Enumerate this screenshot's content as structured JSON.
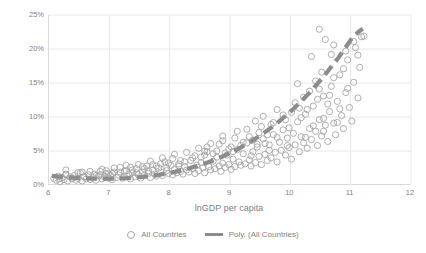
{
  "chart_data": {
    "type": "scatter",
    "title": "",
    "xlabel": "lnGDP per capita",
    "ylabel": "Business Servics Employment Share",
    "xlim": [
      6,
      12
    ],
    "ylim": [
      0,
      25
    ],
    "xticks": [
      "6",
      "7",
      "8",
      "9",
      "10",
      "11",
      "12"
    ],
    "yticks": [
      "0%",
      "5%",
      "10%",
      "15%",
      "20%",
      "25%"
    ],
    "ytick_values": [
      0,
      5,
      10,
      15,
      20,
      25
    ],
    "xtick_values": [
      6,
      7,
      8,
      9,
      10,
      11,
      12
    ],
    "grid": "both-light",
    "legend_position": "bottom",
    "series": [
      {
        "name": "All Countries",
        "type": "scatter",
        "marker": "open-circle",
        "color": "#a6a6a6",
        "points": [
          [
            6.08,
            1.0
          ],
          [
            6.12,
            0.7
          ],
          [
            6.15,
            1.3
          ],
          [
            6.18,
            0.5
          ],
          [
            6.22,
            1.1
          ],
          [
            6.25,
            0.8
          ],
          [
            6.28,
            1.5
          ],
          [
            6.31,
            0.6
          ],
          [
            6.35,
            1.2
          ],
          [
            6.38,
            0.9
          ],
          [
            6.42,
            1.4
          ],
          [
            6.45,
            0.7
          ],
          [
            6.48,
            1.0
          ],
          [
            6.52,
            1.8
          ],
          [
            6.55,
            0.6
          ],
          [
            6.58,
            1.2
          ],
          [
            6.62,
            0.9
          ],
          [
            6.65,
            1.5
          ],
          [
            6.68,
            0.8
          ],
          [
            6.72,
            1.1
          ],
          [
            6.75,
            1.6
          ],
          [
            6.78,
            0.7
          ],
          [
            6.82,
            1.3
          ],
          [
            6.85,
            2.0
          ],
          [
            6.88,
            0.9
          ],
          [
            6.92,
            1.2
          ],
          [
            6.95,
            1.7
          ],
          [
            6.98,
            1.0
          ],
          [
            7.02,
            1.4
          ],
          [
            7.05,
            0.8
          ],
          [
            7.08,
            1.9
          ],
          [
            7.12,
            1.1
          ],
          [
            7.15,
            1.5
          ],
          [
            7.18,
            2.6
          ],
          [
            7.22,
            1.0
          ],
          [
            7.25,
            1.3
          ],
          [
            7.28,
            2.1
          ],
          [
            7.32,
            1.6
          ],
          [
            7.35,
            0.9
          ],
          [
            7.38,
            1.8
          ],
          [
            7.42,
            1.2
          ],
          [
            7.45,
            2.4
          ],
          [
            7.48,
            1.5
          ],
          [
            7.52,
            1.0
          ],
          [
            7.55,
            1.9
          ],
          [
            7.58,
            1.4
          ],
          [
            7.62,
            2.8
          ],
          [
            7.65,
            1.7
          ],
          [
            7.68,
            1.1
          ],
          [
            7.72,
            2.2
          ],
          [
            7.75,
            1.6
          ],
          [
            7.78,
            1.3
          ],
          [
            7.82,
            2.5
          ],
          [
            7.85,
            1.9
          ],
          [
            7.88,
            1.4
          ],
          [
            7.92,
            3.4
          ],
          [
            7.95,
            2.1
          ],
          [
            7.98,
            1.7
          ],
          [
            8.02,
            2.9
          ],
          [
            8.05,
            1.5
          ],
          [
            8.08,
            2.3
          ],
          [
            8.12,
            1.8
          ],
          [
            8.15,
            3.1
          ],
          [
            8.18,
            2.0
          ],
          [
            8.22,
            1.6
          ],
          [
            8.25,
            2.7
          ],
          [
            8.28,
            2.2
          ],
          [
            8.32,
            1.9
          ],
          [
            8.35,
            3.6
          ],
          [
            8.38,
            2.4
          ],
          [
            8.42,
            1.7
          ],
          [
            8.45,
            2.9
          ],
          [
            8.48,
            2.1
          ],
          [
            8.52,
            3.3
          ],
          [
            8.55,
            2.5
          ],
          [
            8.58,
            1.8
          ],
          [
            8.62,
            4.9
          ],
          [
            8.65,
            2.7
          ],
          [
            8.68,
            2.2
          ],
          [
            8.72,
            3.5
          ],
          [
            8.75,
            2.4
          ],
          [
            8.78,
            4.1
          ],
          [
            8.82,
            2.8
          ],
          [
            8.85,
            2.0
          ],
          [
            8.88,
            3.2
          ],
          [
            8.92,
            2.6
          ],
          [
            8.95,
            4.4
          ],
          [
            8.98,
            3.0
          ],
          [
            9.02,
            2.3
          ],
          [
            9.05,
            3.8
          ],
          [
            9.08,
            2.7
          ],
          [
            9.12,
            5.2
          ],
          [
            9.15,
            3.4
          ],
          [
            9.18,
            2.9
          ],
          [
            9.22,
            4.6
          ],
          [
            9.25,
            3.1
          ],
          [
            9.28,
            6.2
          ],
          [
            9.32,
            3.7
          ],
          [
            9.35,
            2.8
          ],
          [
            9.38,
            4.9
          ],
          [
            9.42,
            3.3
          ],
          [
            9.45,
            5.6
          ],
          [
            9.48,
            4.2
          ],
          [
            9.52,
            3.0
          ],
          [
            9.55,
            6.8
          ],
          [
            9.58,
            4.5
          ],
          [
            9.62,
            3.6
          ],
          [
            9.65,
            5.9
          ],
          [
            9.68,
            4.0
          ],
          [
            9.72,
            7.4
          ],
          [
            9.75,
            4.8
          ],
          [
            9.78,
            3.4
          ],
          [
            9.82,
            6.3
          ],
          [
            9.85,
            5.1
          ],
          [
            9.88,
            8.1
          ],
          [
            9.92,
            4.4
          ],
          [
            9.95,
            6.9
          ],
          [
            9.98,
            5.5
          ],
          [
            10.02,
            3.8
          ],
          [
            10.05,
            7.6
          ],
          [
            10.08,
            5.9
          ],
          [
            10.12,
            9.3
          ],
          [
            10.15,
            4.9
          ],
          [
            10.18,
            7.1
          ],
          [
            10.22,
            6.2
          ],
          [
            10.25,
            10.4
          ],
          [
            10.28,
            5.4
          ],
          [
            10.32,
            8.3
          ],
          [
            10.35,
            6.7
          ],
          [
            10.38,
            11.6
          ],
          [
            10.42,
            7.9
          ],
          [
            10.45,
            5.8
          ],
          [
            10.48,
            9.6
          ],
          [
            10.52,
            7.2
          ],
          [
            10.55,
            13.1
          ],
          [
            10.58,
            8.8
          ],
          [
            10.62,
            6.4
          ],
          [
            10.65,
            10.8
          ],
          [
            10.68,
            14.5
          ],
          [
            10.72,
            9.1
          ],
          [
            10.75,
            7.4
          ],
          [
            10.78,
            12.3
          ],
          [
            10.82,
            16.2
          ],
          [
            10.85,
            10.2
          ],
          [
            10.88,
            8.3
          ],
          [
            10.92,
            13.6
          ],
          [
            10.95,
            18.4
          ],
          [
            10.98,
            11.4
          ],
          [
            11.02,
            9.4
          ],
          [
            11.05,
            15.1
          ],
          [
            11.08,
            20.2
          ],
          [
            11.12,
            12.8
          ],
          [
            11.15,
            17.3
          ],
          [
            11.18,
            21.8
          ],
          [
            11.22,
            21.9
          ],
          [
            8.58,
            5.0
          ],
          [
            9.05,
            4.9
          ],
          [
            10.48,
            22.9
          ],
          [
            10.58,
            21.4
          ],
          [
            10.35,
            18.9
          ],
          [
            10.12,
            14.9
          ],
          [
            9.78,
            11.1
          ],
          [
            9.42,
            9.4
          ],
          [
            9.12,
            7.9
          ],
          [
            8.88,
            6.5
          ],
          [
            8.42,
            4.3
          ],
          [
            8.05,
            3.9
          ],
          [
            7.72,
            3.0
          ],
          [
            7.35,
            2.6
          ],
          [
            6.95,
            2.1
          ],
          [
            6.55,
            1.9
          ],
          [
            6.28,
            2.2
          ],
          [
            10.82,
            11.2
          ],
          [
            10.72,
            15.8
          ],
          [
            10.65,
            13.2
          ],
          [
            10.55,
            9.8
          ],
          [
            10.45,
            12.6
          ],
          [
            10.38,
            8.7
          ],
          [
            10.28,
            11.1
          ],
          [
            10.18,
            9.9
          ],
          [
            10.08,
            12.1
          ],
          [
            9.98,
            8.4
          ],
          [
            9.88,
            10.3
          ],
          [
            9.78,
            7.0
          ],
          [
            9.68,
            8.9
          ],
          [
            9.58,
            6.1
          ],
          [
            9.48,
            7.7
          ],
          [
            9.38,
            6.6
          ],
          [
            9.28,
            8.2
          ],
          [
            9.18,
            5.8
          ],
          [
            9.08,
            6.9
          ],
          [
            8.98,
            5.3
          ],
          [
            8.88,
            7.2
          ],
          [
            8.78,
            5.0
          ],
          [
            8.68,
            6.1
          ],
          [
            8.58,
            4.4
          ],
          [
            8.48,
            5.4
          ],
          [
            8.38,
            4.0
          ],
          [
            8.28,
            4.8
          ],
          [
            8.18,
            3.6
          ],
          [
            8.08,
            4.5
          ],
          [
            7.98,
            3.2
          ],
          [
            7.88,
            4.0
          ],
          [
            7.78,
            2.8
          ],
          [
            7.68,
            3.5
          ],
          [
            7.58,
            2.4
          ],
          [
            7.48,
            3.0
          ],
          [
            7.38,
            2.2
          ],
          [
            7.28,
            2.9
          ],
          [
            7.18,
            1.9
          ],
          [
            7.08,
            2.5
          ],
          [
            6.98,
            1.6
          ],
          [
            6.88,
            2.3
          ],
          [
            6.78,
            1.4
          ],
          [
            6.68,
            2.0
          ],
          [
            6.58,
            1.2
          ],
          [
            6.48,
            1.8
          ],
          [
            6.38,
            1.0
          ],
          [
            6.28,
            1.6
          ],
          [
            6.18,
            0.9
          ],
          [
            10.92,
            19.7
          ],
          [
            10.88,
            17.1
          ],
          [
            10.68,
            19.2
          ],
          [
            10.52,
            16.6
          ],
          [
            10.42,
            15.3
          ],
          [
            10.32,
            13.8
          ],
          [
            10.22,
            12.9
          ],
          [
            10.02,
            10.7
          ],
          [
            9.92,
            9.6
          ],
          [
            9.72,
            9.2
          ],
          [
            9.62,
            7.4
          ],
          [
            9.52,
            8.6
          ],
          [
            9.32,
            7.1
          ],
          [
            9.22,
            6.3
          ],
          [
            9.02,
            5.6
          ],
          [
            8.92,
            4.7
          ],
          [
            8.82,
            6.0
          ],
          [
            8.72,
            4.6
          ],
          [
            8.62,
            5.6
          ],
          [
            8.52,
            4.1
          ],
          [
            9.35,
            4.3
          ],
          [
            9.65,
            5.1
          ],
          [
            9.95,
            5.8
          ],
          [
            10.25,
            7.0
          ],
          [
            10.55,
            7.9
          ],
          [
            8.25,
            3.4
          ],
          [
            8.15,
            2.8
          ],
          [
            7.95,
            2.5
          ],
          [
            7.85,
            3.1
          ],
          [
            7.65,
            2.1
          ],
          [
            7.55,
            2.7
          ],
          [
            7.45,
            1.8
          ],
          [
            7.25,
            2.0
          ],
          [
            7.05,
            1.7
          ],
          [
            6.85,
            1.5
          ],
          [
            10.78,
            9.2
          ],
          [
            10.62,
            11.9
          ],
          [
            10.15,
            11.3
          ],
          [
            9.55,
            10.1
          ],
          [
            9.45,
            6.0
          ],
          [
            11.12,
            19.1
          ],
          [
            11.05,
            21.1
          ],
          [
            10.95,
            14.2
          ],
          [
            10.72,
            20.6
          ],
          [
            10.48,
            14.1
          ]
        ]
      },
      {
        "name": "Poly. (All Countries)",
        "type": "line",
        "style": "dashed",
        "color": "#8c8c8c",
        "fit": "polynomial",
        "points": [
          [
            6.05,
            1.35
          ],
          [
            6.3,
            1.15
          ],
          [
            6.55,
            1.0
          ],
          [
            6.8,
            0.92
          ],
          [
            7.05,
            0.92
          ],
          [
            7.3,
            1.0
          ],
          [
            7.55,
            1.18
          ],
          [
            7.8,
            1.46
          ],
          [
            8.05,
            1.86
          ],
          [
            8.3,
            2.38
          ],
          [
            8.55,
            3.05
          ],
          [
            8.8,
            3.88
          ],
          [
            9.05,
            4.9
          ],
          [
            9.3,
            6.12
          ],
          [
            9.55,
            7.56
          ],
          [
            9.8,
            9.24
          ],
          [
            10.05,
            11.18
          ],
          [
            10.3,
            13.4
          ],
          [
            10.55,
            15.92
          ],
          [
            10.8,
            18.76
          ],
          [
            11.05,
            21.94
          ],
          [
            11.2,
            23.0
          ]
        ]
      }
    ]
  },
  "legend": {
    "entries": [
      {
        "label": "All Countries",
        "marker": "open-circle-marker"
      },
      {
        "label": "Poly. (All Countries)",
        "marker": "dashed-line-marker"
      }
    ]
  },
  "colors": {
    "marker_stroke": "#a6a6a6",
    "trend_line": "#8c8c8c",
    "gridline": "#e8e8e8",
    "axis": "#d9d9d9",
    "text": "#7f7f7f",
    "background": "#ffffff"
  }
}
